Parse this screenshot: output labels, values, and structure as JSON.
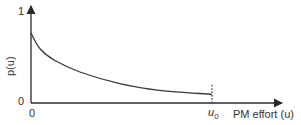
{
  "chart_data": {
    "type": "line",
    "title": "",
    "xlabel": "PM effort (u)",
    "ylabel": "p(u)",
    "x_ticks": [
      {
        "label": "0",
        "value": 0
      },
      {
        "label": "u0",
        "value": 1
      }
    ],
    "y_ticks": [
      {
        "label": "0",
        "value": 0
      },
      {
        "label": "1",
        "value": 1
      }
    ],
    "xlim": [
      0,
      1.15
    ],
    "ylim": [
      0,
      1
    ],
    "grid": false,
    "legend": null,
    "annotations": [
      {
        "type": "vertical-dotted-line",
        "x": 1,
        "label": "u0",
        "note": "curve ends at u0"
      }
    ],
    "series": [
      {
        "name": "p(u)",
        "description": "monotonically decreasing convex curve starting near 0.72 at u=0 and flattening to about 0.09 at u=u0",
        "x": [
          0,
          0.05,
          0.13,
          0.27,
          0.49,
          0.71,
          1.0
        ],
        "y": [
          0.72,
          0.56,
          0.44,
          0.32,
          0.2,
          0.13,
          0.09
        ]
      }
    ]
  },
  "labels": {
    "y_top_tick": "1",
    "y_zero_tick": "0",
    "x_zero_tick": "0",
    "u0_main": "u",
    "u0_sub": "0",
    "x_axis_title": "PM effort (u)",
    "y_axis_title": "p(u)"
  },
  "colors": {
    "axis": "#2a2a2a",
    "curve": "#3a3a3a",
    "text": "#333333"
  }
}
